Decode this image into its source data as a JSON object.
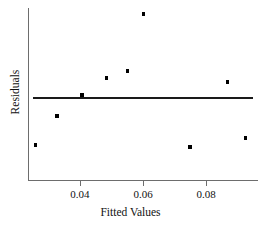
{
  "chart_data": {
    "type": "scatter",
    "title": "",
    "xlabel": "Fitted Values",
    "ylabel": "Residuals",
    "xticklabels": [
      "0.04",
      "0.06",
      "0.08"
    ],
    "xtickvalues": [
      0.04,
      0.06,
      0.08
    ],
    "yticklabels": [],
    "xlim": [
      0.0235,
      0.0965
    ],
    "ylim": [
      -0.62,
      1.0
    ],
    "grid": false,
    "legend": null,
    "reference_line": {
      "type": "horizontal",
      "y": 0,
      "label": "zero-residual-line"
    },
    "x": [
      0.0258,
      0.0327,
      0.0406,
      0.0485,
      0.0551,
      0.0601,
      0.0749,
      0.0869,
      0.0926
    ],
    "y": [
      -0.48,
      -0.19,
      0.02,
      0.19,
      0.26,
      0.83,
      -0.5,
      0.15,
      -0.41
    ],
    "points": [
      {
        "x": 0.0258,
        "y": -0.48
      },
      {
        "x": 0.0327,
        "y": -0.19
      },
      {
        "x": 0.0406,
        "y": 0.02
      },
      {
        "x": 0.0485,
        "y": 0.19
      },
      {
        "x": 0.0551,
        "y": 0.26
      },
      {
        "x": 0.0601,
        "y": 0.83
      },
      {
        "x": 0.0749,
        "y": -0.5
      },
      {
        "x": 0.0869,
        "y": 0.15
      },
      {
        "x": 0.0926,
        "y": -0.41
      }
    ],
    "marker": "square",
    "marker_color": "#000000",
    "line_color": "#1a1a1a",
    "axis_color": "#6d6d6d",
    "background_color": "#ffffff"
  },
  "axis": {
    "x_title": "Fitted Values",
    "y_title": "Residuals"
  }
}
